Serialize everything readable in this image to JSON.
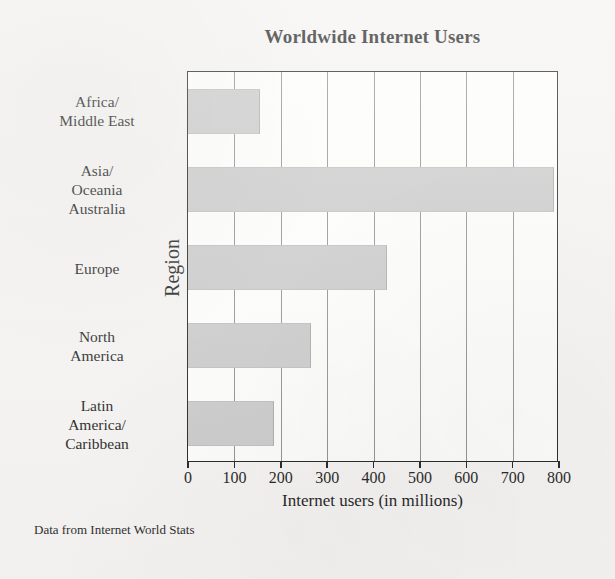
{
  "figure": {
    "title": "Worldwide Internet Users",
    "source_note": "Data from Internet World Stats",
    "bar_color": "#c9c9c9",
    "frame_color": "#1d1d1d",
    "background_color": "#f4f3f1",
    "plot_background_color": "#fdfdfc"
  },
  "chart_data": {
    "type": "bar",
    "orientation": "horizontal",
    "title": "Worldwide Internet Users",
    "xlabel": "Internet users (in millions)",
    "ylabel": "Region",
    "xlim": [
      0,
      800
    ],
    "xticks": [
      0,
      100,
      200,
      300,
      400,
      500,
      600,
      700,
      800
    ],
    "xtick_labels": [
      "0",
      "100",
      "200",
      "300",
      "400",
      "500",
      "600",
      "700",
      "800"
    ],
    "grid": "vertical gridlines at each 100 interval",
    "legend": "none",
    "categories": [
      "Africa/\nMiddle East",
      "Asia/\nOceania\nAustralia",
      "Europe",
      "North\nAmerica",
      "Latin\nAmerica/\nCaribbean"
    ],
    "category_lines": [
      [
        "Africa/",
        "Middle East"
      ],
      [
        "Asia/",
        "Oceania",
        "Australia"
      ],
      [
        "Europe"
      ],
      [
        "North",
        "America"
      ],
      [
        "Latin",
        "America/",
        "Caribbean"
      ]
    ],
    "values": [
      155,
      790,
      430,
      265,
      185
    ],
    "units": "millions of internet users",
    "annotations": [
      "Data from Internet World Stats"
    ]
  }
}
